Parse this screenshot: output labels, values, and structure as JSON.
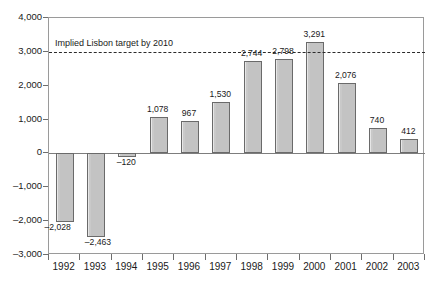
{
  "chart_data": {
    "type": "bar",
    "title": "",
    "subtitle": "",
    "xlabel": "",
    "ylabel": "",
    "categories": [
      "1992",
      "1993",
      "1994",
      "1995",
      "1996",
      "1997",
      "1998",
      "1999",
      "2000",
      "2001",
      "2002",
      "2003"
    ],
    "values": [
      -2028,
      -2463,
      -120,
      1078,
      967,
      1530,
      2744,
      2798,
      3291,
      2076,
      740,
      412
    ],
    "value_labels": [
      "–2,028",
      "–2,463",
      "–120",
      "1,078",
      "967",
      "1,530",
      "2,744",
      "2,798",
      "3,291",
      "2,076",
      "740",
      "412"
    ],
    "ylim": [
      -3000,
      4000
    ],
    "y_ticks": [
      4000,
      3000,
      2000,
      1000,
      0,
      -1000,
      -2000,
      -3000
    ],
    "y_tick_labels": [
      "4,000",
      "3,000",
      "2,000",
      "1,000",
      "0",
      "–1,000",
      "–2,000",
      "–3,000"
    ],
    "grid": false,
    "legend": null,
    "annotations": [
      {
        "name": "implied-lisbon-target",
        "text": "Implied Lisbon target by 2010",
        "value": 3000,
        "style": "dashed-horizontal-line"
      }
    ],
    "colors": {
      "bar_fill": "#c9c9c9",
      "bar_stroke": "#6a6a6a",
      "axis": "#6e6e6e",
      "frame": "#9a9a9a",
      "target_line": "#2b2b2b",
      "text": "#1a1a1a",
      "background": "#ffffff"
    }
  }
}
